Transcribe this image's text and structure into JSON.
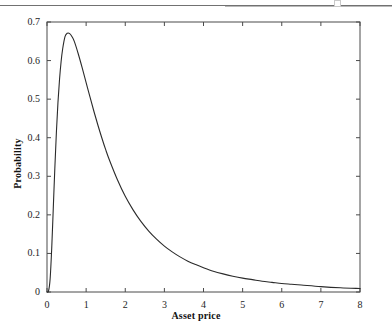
{
  "figure": {
    "background_color": "#ffffff",
    "frame_color": "#4a4a4a",
    "curve_color": "#2b2b2b",
    "page_rule_color": "#585858"
  },
  "chart_data": {
    "type": "line",
    "title": "",
    "subtitle": "",
    "xlabel": "Asset price",
    "ylabel": "Probability",
    "xlim": [
      0,
      8
    ],
    "ylim": [
      0,
      0.7
    ],
    "xticks": [
      0,
      1,
      2,
      3,
      4,
      5,
      6,
      7,
      8
    ],
    "xtick_labels": [
      "0",
      "1",
      "2",
      "3",
      "4",
      "5",
      "6",
      "7",
      "8"
    ],
    "yticks": [
      0,
      0.1,
      0.2,
      0.3,
      0.4,
      0.5,
      0.6,
      0.7
    ],
    "ytick_labels": [
      "0",
      "0.1",
      "0.2",
      "0.3",
      "0.4",
      "0.5",
      "0.6",
      "0.7"
    ],
    "grid": false,
    "legend": false,
    "legend_position": "none",
    "frame": "box",
    "tick_direction": "in",
    "annotations": [],
    "peak": {
      "x": 0.46,
      "y": 0.672
    },
    "series": [
      {
        "name": "Asset price probability density",
        "x": [
          0.0,
          0.04,
          0.08,
          0.12,
          0.16,
          0.2,
          0.24,
          0.28,
          0.32,
          0.36,
          0.4,
          0.46,
          0.52,
          0.58,
          0.64,
          0.7,
          0.8,
          0.9,
          1.0,
          1.1,
          1.2,
          1.3,
          1.4,
          1.5,
          1.6,
          1.8,
          2.0,
          2.2,
          2.4,
          2.6,
          2.8,
          3.0,
          3.2,
          3.4,
          3.6,
          3.8,
          4.0,
          4.25,
          4.5,
          4.75,
          5.0,
          5.25,
          5.5,
          5.75,
          6.0,
          6.25,
          6.5,
          7.0,
          7.5,
          8.0
        ],
        "y": [
          0.0,
          0.003,
          0.034,
          0.112,
          0.216,
          0.321,
          0.414,
          0.491,
          0.551,
          0.597,
          0.63,
          0.662,
          0.671,
          0.67,
          0.662,
          0.649,
          0.617,
          0.581,
          0.543,
          0.505,
          0.468,
          0.433,
          0.4,
          0.369,
          0.341,
          0.291,
          0.248,
          0.213,
          0.183,
          0.158,
          0.137,
          0.119,
          0.104,
          0.091,
          0.08,
          0.071,
          0.063,
          0.054,
          0.047,
          0.041,
          0.036,
          0.032,
          0.028,
          0.025,
          0.022,
          0.02,
          0.018,
          0.014,
          0.011,
          0.009
        ]
      }
    ]
  }
}
